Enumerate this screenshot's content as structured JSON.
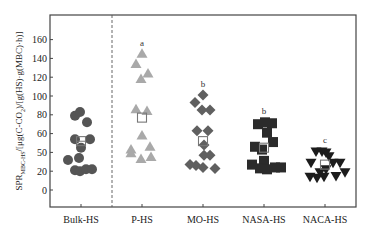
{
  "chart_data": {
    "type": "scatter",
    "title": "",
    "xlabel": "",
    "ylabel": "SPR_MBC-HS/[μg(C-CO2)/[g(HS)·g(MBC)·h)]",
    "ylabel_main": "SPR",
    "ylabel_sub": "MBC-HS",
    "ylabel_rest": "/[μg(C-CO",
    "ylabel_sub2": "2",
    "ylabel_tail": ")/[g(HS)·g(MBC)·h)]",
    "ylim": [
      -15,
      175
    ],
    "yticks": [
      0,
      20,
      40,
      60,
      80,
      100,
      120,
      140,
      160
    ],
    "ytick_labels": [
      "0",
      "20",
      "50",
      "60",
      "80",
      "100",
      "120",
      "140",
      "160"
    ],
    "categories": [
      "Bulk-HS",
      "P-HS",
      "MO-HS",
      "NASA-HS",
      "NACA-HS"
    ],
    "grid": false,
    "legend": "none",
    "separator_after": "Bulk-HS",
    "series": [
      {
        "name": "Bulk-HS",
        "marker": "circle",
        "color": "#555555",
        "letter": "",
        "mean": 52,
        "points": [
          {
            "dx": -6,
            "v": 79
          },
          {
            "dx": -1,
            "v": 83
          },
          {
            "dx": 6,
            "v": 72
          },
          {
            "dx": -6,
            "v": 54
          },
          {
            "dx": 9,
            "v": 54
          },
          {
            "dx": 0,
            "v": 45
          },
          {
            "dx": -13,
            "v": 32
          },
          {
            "dx": -2,
            "v": 34
          },
          {
            "dx": -6,
            "v": 21
          },
          {
            "dx": -1,
            "v": 20
          },
          {
            "dx": 5,
            "v": 22
          },
          {
            "dx": 11,
            "v": 22
          }
        ]
      },
      {
        "name": "P-HS",
        "marker": "triangle-up",
        "color": "#a9a9a9",
        "letter": "a",
        "mean": 77,
        "points": [
          {
            "dx": 0,
            "v": 145
          },
          {
            "dx": -6,
            "v": 134
          },
          {
            "dx": 6,
            "v": 124
          },
          {
            "dx": -1,
            "v": 118
          },
          {
            "dx": -6,
            "v": 86
          },
          {
            "dx": 5,
            "v": 84
          },
          {
            "dx": 0,
            "v": 58
          },
          {
            "dx": 8,
            "v": 46
          },
          {
            "dx": -11,
            "v": 43
          },
          {
            "dx": -11,
            "v": 39
          },
          {
            "dx": 9,
            "v": 35
          },
          {
            "dx": -1,
            "v": 33
          }
        ]
      },
      {
        "name": "MO-HS",
        "marker": "diamond",
        "color": "#606060",
        "letter": "b",
        "mean": 52,
        "points": [
          {
            "dx": 0,
            "v": 101
          },
          {
            "dx": -8,
            "v": 93
          },
          {
            "dx": -1,
            "v": 85
          },
          {
            "dx": 7,
            "v": 85
          },
          {
            "dx": -6,
            "v": 63
          },
          {
            "dx": 5,
            "v": 63
          },
          {
            "dx": 1,
            "v": 48
          },
          {
            "dx": 1,
            "v": 37
          },
          {
            "dx": 7,
            "v": 37
          },
          {
            "dx": -13,
            "v": 27
          },
          {
            "dx": -7,
            "v": 26
          },
          {
            "dx": 0,
            "v": 24
          },
          {
            "dx": 12,
            "v": 23
          }
        ]
      },
      {
        "name": "NASA-HS",
        "marker": "square",
        "color": "#2b2b2b",
        "letter": "b",
        "mean": 45,
        "points": [
          {
            "dx": -6,
            "v": 70
          },
          {
            "dx": 1,
            "v": 72
          },
          {
            "dx": 8,
            "v": 71
          },
          {
            "dx": 3,
            "v": 61
          },
          {
            "dx": 9,
            "v": 51
          },
          {
            "dx": -9,
            "v": 46
          },
          {
            "dx": -2,
            "v": 43
          },
          {
            "dx": 0,
            "v": 31
          },
          {
            "dx": -12,
            "v": 27
          },
          {
            "dx": -4,
            "v": 23
          },
          {
            "dx": 3,
            "v": 22
          },
          {
            "dx": 11,
            "v": 24
          },
          {
            "dx": 17,
            "v": 24
          }
        ]
      },
      {
        "name": "NACA-HS",
        "marker": "triangle-down",
        "color": "#1c1c1c",
        "letter": "c",
        "mean": 27,
        "points": [
          {
            "dx": -9,
            "v": 41
          },
          {
            "dx": -3,
            "v": 41
          },
          {
            "dx": 1,
            "v": 40
          },
          {
            "dx": 4,
            "v": 36
          },
          {
            "dx": -14,
            "v": 29
          },
          {
            "dx": 8,
            "v": 29
          },
          {
            "dx": 15,
            "v": 29
          },
          {
            "dx": 1,
            "v": 22
          },
          {
            "dx": -5,
            "v": 19
          },
          {
            "dx": 20,
            "v": 19
          },
          {
            "dx": -15,
            "v": 14
          },
          {
            "dx": -8,
            "v": 13
          },
          {
            "dx": -1,
            "v": 14
          },
          {
            "dx": 11,
            "v": 15
          }
        ]
      }
    ]
  }
}
